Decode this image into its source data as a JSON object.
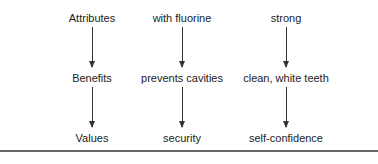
{
  "columns": [
    {
      "x": 92,
      "items": [
        "Attributes",
        "Benefits",
        "Values"
      ]
    },
    {
      "x": 182,
      "items": [
        "with fluorine",
        "prevents cavities",
        "security"
      ]
    },
    {
      "x": 286,
      "items": [
        "strong",
        "clean, white teeth",
        "self-confidence"
      ]
    }
  ]
}
